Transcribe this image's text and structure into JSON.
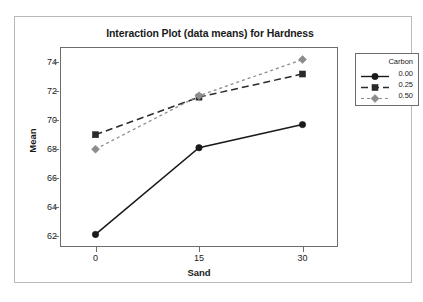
{
  "chart_data": {
    "type": "line",
    "title": "Interaction Plot (data means) for Hardness",
    "xlabel": "Sand",
    "ylabel": "Mean",
    "x": [
      0,
      15,
      30
    ],
    "xtick_labels": [
      "0",
      "15",
      "30"
    ],
    "ytick_labels": [
      "62",
      "64",
      "66",
      "68",
      "70",
      "72",
      "74"
    ],
    "ytick_values": [
      62,
      64,
      66,
      68,
      70,
      72,
      74
    ],
    "ylim": [
      61.3,
      75.0
    ],
    "xlim": [
      -5,
      35
    ],
    "grid": false,
    "legend_position": "right-outside",
    "legend_title": "Carbon",
    "series": [
      {
        "name": "0.00",
        "values": [
          62.1,
          68.1,
          69.7
        ],
        "marker": "circle",
        "line_style": "solid",
        "color": "#1a1a1a"
      },
      {
        "name": "0.25",
        "values": [
          69.0,
          71.6,
          73.2
        ],
        "marker": "square",
        "line_style": "dashed",
        "color": "#2b2b2b"
      },
      {
        "name": "0.50",
        "values": [
          68.0,
          71.7,
          74.2
        ],
        "marker": "diamond",
        "line_style": "dotted",
        "color": "#8c8c8c"
      }
    ]
  }
}
